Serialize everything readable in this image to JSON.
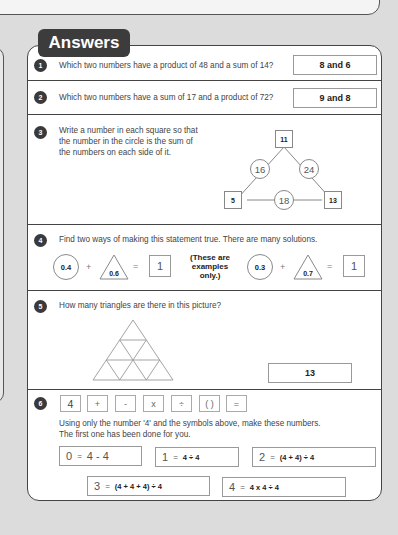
{
  "header": {
    "title": "Answers"
  },
  "questions": [
    {
      "number": "1",
      "text": "Which two numbers have a product of 48 and a sum of 14?",
      "answer": "8 and 6"
    },
    {
      "number": "2",
      "text": "Which two numbers have a sum of 17 and a product of 72?",
      "answer": "9 and 8"
    },
    {
      "number": "3",
      "text_lines": [
        "Write a number in each square so that",
        "the number in the circle is the sum of",
        "the numbers on each side of it."
      ],
      "diagram": {
        "squares": {
          "top": "11",
          "left": "5",
          "right": "13"
        },
        "circles": {
          "left": "16",
          "right": "24",
          "bottom": "18"
        }
      }
    },
    {
      "number": "4",
      "text": "Find two ways of making this statement true. There are many solutions.",
      "examples": [
        {
          "circle": "0.4",
          "plus": "+",
          "triangle": "0.6",
          "equals": "=",
          "result": "1"
        },
        {
          "circle": "0.3",
          "plus": "+",
          "triangle": "0.7",
          "equals": "=",
          "result": "1"
        }
      ],
      "note_lines": [
        "(These are",
        "examples",
        "only.)"
      ]
    },
    {
      "number": "5",
      "text": "How many triangles are there in this picture?",
      "answer": "13"
    },
    {
      "number": "6",
      "symbols": [
        "4",
        "+",
        "-",
        "x",
        "÷",
        "( )",
        "="
      ],
      "text_lines": [
        "Using only the number '4' and the symbols above, make these numbers.",
        "The first one has been done for you."
      ],
      "expressions": [
        {
          "lhs": "0",
          "eq": "=",
          "rhs": "4 - 4",
          "given": true
        },
        {
          "lhs": "1",
          "eq": "=",
          "rhs": "4 ÷ 4"
        },
        {
          "lhs": "2",
          "eq": "=",
          "rhs": "(4 + 4) ÷ 4"
        },
        {
          "lhs": "3",
          "eq": "=",
          "rhs": "(4 + 4 + 4) ÷ 4"
        },
        {
          "lhs": "4",
          "eq": "=",
          "rhs": "4 x 4 ÷ 4"
        }
      ]
    }
  ],
  "colors": {
    "badge": "#3a3a3a",
    "border": "#444444",
    "page_bg": "#dcdcdc"
  }
}
